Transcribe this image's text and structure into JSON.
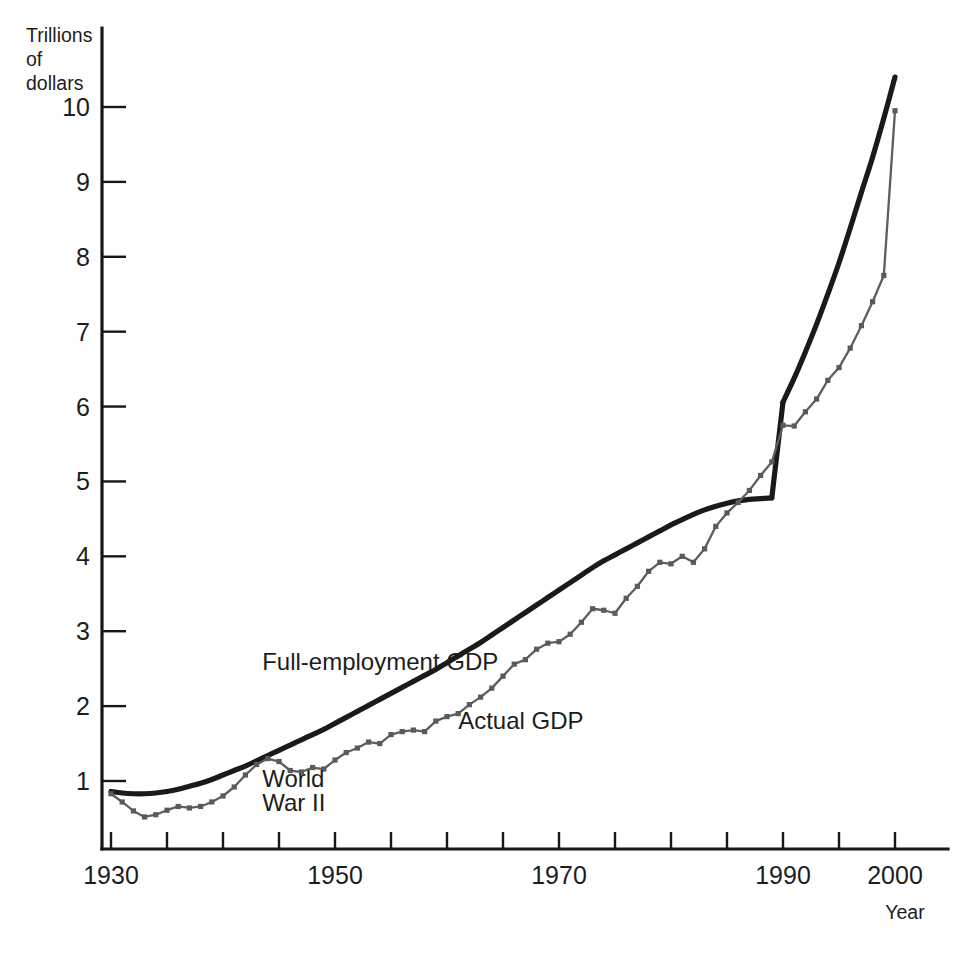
{
  "chart_data": {
    "type": "line",
    "title": "",
    "xlabel": "Year",
    "ylabel": "Trillions of dollars",
    "ylabel_lines": [
      "Trillions",
      "of",
      "dollars"
    ],
    "xlim": [
      1929,
      2001
    ],
    "ylim": [
      0,
      10.7
    ],
    "grid": false,
    "legend_position": "inline-annotations",
    "xticks": [
      1930,
      1935,
      1940,
      1945,
      1950,
      1955,
      1960,
      1965,
      1970,
      1975,
      1980,
      1985,
      1990,
      1995,
      2000
    ],
    "xtick_labels": [
      "1930",
      "",
      "",
      "",
      "1950",
      "",
      "",
      "",
      "1970",
      "",
      "",
      "",
      "1990",
      "",
      "2000"
    ],
    "yticks": [
      1,
      2,
      3,
      4,
      5,
      6,
      7,
      8,
      9,
      10
    ],
    "ytick_labels": [
      "1",
      "2",
      "3",
      "4",
      "5",
      "6",
      "7",
      "8",
      "9",
      "10"
    ],
    "annotations": [
      {
        "text": "Full-employment GDP",
        "x": 1943.5,
        "y": 2.48,
        "name": "annotation-full-employment-gdp"
      },
      {
        "text": "Actual GDP",
        "x": 1961.0,
        "y": 1.7,
        "name": "annotation-actual-gdp"
      },
      {
        "text": "World",
        "x": 1943.5,
        "y": 0.92,
        "name": "annotation-world"
      },
      {
        "text": "War II",
        "x": 1943.5,
        "y": 0.6,
        "name": "annotation-war-ii"
      }
    ],
    "series": [
      {
        "name": "Full-employment GDP",
        "style": "thick-solid",
        "color": "#1a1a1a",
        "markers": false,
        "note": "Smooth potential-output trend; discontinuous upward jump at 1990 due to series rebasing.",
        "x": [
          1930,
          1931,
          1932,
          1933,
          1934,
          1935,
          1936,
          1937,
          1938,
          1939,
          1940,
          1941,
          1942,
          1943,
          1944,
          1945,
          1946,
          1947,
          1948,
          1949,
          1950,
          1951,
          1952,
          1953,
          1954,
          1955,
          1956,
          1957,
          1958,
          1959,
          1960,
          1961,
          1962,
          1963,
          1964,
          1965,
          1966,
          1967,
          1968,
          1969,
          1970,
          1971,
          1972,
          1973,
          1974,
          1975,
          1976,
          1977,
          1978,
          1979,
          1980,
          1981,
          1982,
          1983,
          1984,
          1985,
          1986,
          1987,
          1988,
          1989,
          1990,
          1991,
          1992,
          1993,
          1994,
          1995,
          1996,
          1997,
          1998,
          1999,
          2000
        ],
        "y": [
          0.86,
          0.84,
          0.83,
          0.83,
          0.84,
          0.86,
          0.89,
          0.93,
          0.97,
          1.02,
          1.08,
          1.14,
          1.2,
          1.27,
          1.34,
          1.41,
          1.48,
          1.55,
          1.62,
          1.69,
          1.77,
          1.85,
          1.93,
          2.01,
          2.09,
          2.17,
          2.25,
          2.33,
          2.41,
          2.49,
          2.58,
          2.67,
          2.76,
          2.85,
          2.95,
          3.05,
          3.15,
          3.25,
          3.35,
          3.45,
          3.55,
          3.65,
          3.75,
          3.85,
          3.94,
          4.02,
          4.1,
          4.18,
          4.26,
          4.34,
          4.42,
          4.49,
          4.56,
          4.62,
          4.67,
          4.71,
          4.74,
          4.76,
          4.77,
          4.78,
          6.06,
          6.38,
          6.73,
          7.1,
          7.5,
          7.92,
          8.38,
          8.86,
          9.33,
          9.85,
          10.4
        ]
      },
      {
        "name": "Actual GDP",
        "style": "thin-solid-with-markers",
        "color": "#5e5e5e",
        "markers": true,
        "note": "Annual real GDP; Great Depression trough ~1933, WWII boom, post-war cycles, 1990 rebasing jump.",
        "x": [
          1930,
          1931,
          1932,
          1933,
          1934,
          1935,
          1936,
          1937,
          1938,
          1939,
          1940,
          1941,
          1942,
          1943,
          1944,
          1945,
          1946,
          1947,
          1948,
          1949,
          1950,
          1951,
          1952,
          1953,
          1954,
          1955,
          1956,
          1957,
          1958,
          1959,
          1960,
          1961,
          1962,
          1963,
          1964,
          1965,
          1966,
          1967,
          1968,
          1969,
          1970,
          1971,
          1972,
          1973,
          1974,
          1975,
          1976,
          1977,
          1978,
          1979,
          1980,
          1981,
          1982,
          1983,
          1984,
          1985,
          1986,
          1987,
          1988,
          1989,
          1990,
          1991,
          1992,
          1993,
          1994,
          1995,
          1996,
          1997,
          1998,
          1999,
          2000
        ],
        "y": [
          0.83,
          0.72,
          0.6,
          0.52,
          0.55,
          0.61,
          0.66,
          0.64,
          0.66,
          0.72,
          0.8,
          0.92,
          1.08,
          1.22,
          1.3,
          1.26,
          1.14,
          1.12,
          1.18,
          1.16,
          1.28,
          1.38,
          1.44,
          1.52,
          1.5,
          1.62,
          1.66,
          1.68,
          1.66,
          1.8,
          1.86,
          1.9,
          2.02,
          2.12,
          2.24,
          2.4,
          2.56,
          2.62,
          2.76,
          2.84,
          2.86,
          2.96,
          3.12,
          3.3,
          3.28,
          3.24,
          3.44,
          3.6,
          3.8,
          3.92,
          3.9,
          4.0,
          3.92,
          4.1,
          4.4,
          4.58,
          4.72,
          4.88,
          5.08,
          5.26,
          5.75,
          5.74,
          5.93,
          6.1,
          6.35,
          6.52,
          6.78,
          7.08,
          7.4,
          7.75,
          9.95
        ]
      }
    ]
  },
  "figure": {
    "ghost_text": "",
    "background_color": "#ffffff",
    "axis_color": "#171717",
    "potential_color": "#1a1a1a",
    "actual_color": "#5e5e5e"
  }
}
